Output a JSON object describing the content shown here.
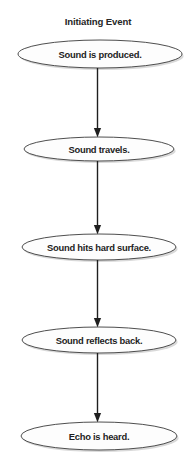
{
  "diagram": {
    "title": "Initiating Event",
    "type": "flowchart",
    "orientation": "vertical-top-to-bottom",
    "background_color": "#ffffff",
    "node_fill_color": "#fdfdfd",
    "node_stroke_color": "#3a3a3a",
    "connector_color": "#1f1f1f",
    "text_color": "#1d1d1d",
    "node_count": 5,
    "connector_count": 4,
    "nodes": [
      {
        "id": "node-1",
        "label": "Sound is produced.",
        "shape": "ellipse",
        "cx": 100,
        "cy": 54,
        "rx": 82,
        "ry": 14
      },
      {
        "id": "node-2",
        "label": "Sound travels.",
        "shape": "ellipse",
        "cx": 99,
        "cy": 149,
        "rx": 75,
        "ry": 12
      },
      {
        "id": "node-3",
        "label": "Sound hits hard surface.",
        "shape": "ellipse",
        "cx": 99,
        "cy": 247,
        "rx": 77,
        "ry": 13
      },
      {
        "id": "node-4",
        "label": "Sound reflects back.",
        "shape": "ellipse",
        "cx": 99,
        "cy": 340,
        "rx": 77,
        "ry": 13
      },
      {
        "id": "node-5",
        "label": "Echo is heard.",
        "shape": "ellipse",
        "cx": 99,
        "cy": 436,
        "rx": 78,
        "ry": 14
      }
    ],
    "connectors": [
      {
        "id": "connector-1",
        "from": "node-1",
        "to": "node-2",
        "x": 97.5,
        "y1": 68,
        "y2": 137
      },
      {
        "id": "connector-2",
        "from": "node-2",
        "to": "node-3",
        "x": 97.5,
        "y1": 161,
        "y2": 234
      },
      {
        "id": "connector-3",
        "from": "node-3",
        "to": "node-4",
        "x": 97.5,
        "y1": 260,
        "y2": 327
      },
      {
        "id": "connector-4",
        "from": "node-4",
        "to": "node-5",
        "x": 97.5,
        "y1": 353,
        "y2": 422
      }
    ]
  }
}
